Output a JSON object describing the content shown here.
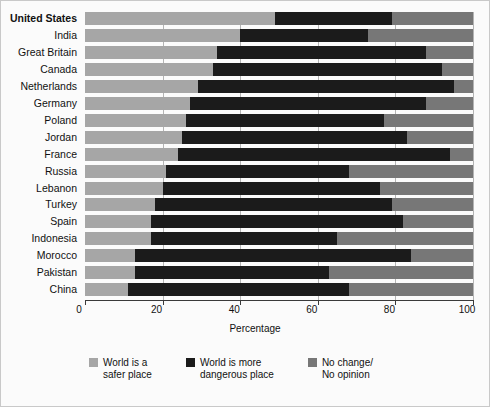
{
  "chart_data": {
    "type": "bar",
    "orientation": "horizontal",
    "stacked": true,
    "title": "",
    "xlabel": "Percentage",
    "ylabel": "",
    "xlim": [
      0,
      100
    ],
    "xticks": [
      0,
      20,
      40,
      60,
      80,
      100
    ],
    "xtick_labels": [
      "0",
      "20",
      "40",
      "60",
      "80",
      "100"
    ],
    "grid": "vertical",
    "legend_position": "bottom",
    "categories": [
      "United States",
      "India",
      "Great Britain",
      "Canada",
      "Netherlands",
      "Germany",
      "Poland",
      "Jordan",
      "France",
      "Russia",
      "Lebanon",
      "Turkey",
      "Spain",
      "Indonesia",
      "Morocco",
      "Pakistan",
      "China"
    ],
    "series": [
      {
        "name": "World is a safer place",
        "color": "#a6a6a6",
        "values": [
          49,
          40,
          34,
          33,
          29,
          27,
          26,
          25,
          24,
          21,
          20,
          18,
          17,
          17,
          13,
          13,
          11
        ]
      },
      {
        "name": "World is more dangerous place",
        "color": "#1b1b1b",
        "values": [
          30,
          33,
          54,
          59,
          66,
          61,
          51,
          58,
          70,
          47,
          56,
          61,
          65,
          48,
          71,
          50,
          57
        ]
      },
      {
        "name": "No change/No opinion",
        "color": "#777777",
        "values": [
          21,
          27,
          12,
          8,
          5,
          12,
          23,
          17,
          6,
          32,
          24,
          21,
          18,
          35,
          16,
          37,
          32
        ]
      }
    ]
  },
  "axis": {
    "x_title": "Percentage"
  },
  "legend": {
    "items": [
      {
        "label": "World is a\nsafer place",
        "swatch": "safer-swatch"
      },
      {
        "label": "World is more\ndangerous place",
        "swatch": "danger-swatch"
      },
      {
        "label": "No change/\nNo opinion",
        "swatch": "nochange-swatch"
      }
    ]
  }
}
